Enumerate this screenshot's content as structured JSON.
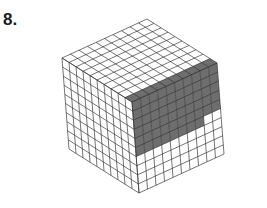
{
  "problem": {
    "number_label": "8."
  },
  "figure": {
    "grid_size": 10,
    "colors": {
      "line": "#3a3a3a",
      "shade": "#6e6e6e",
      "background": "#ffffff"
    },
    "vertices": {
      "top": [
        138,
        16
      ],
      "left": [
        62,
        58
      ],
      "front": [
        132,
        102
      ],
      "right": [
        217,
        63
      ],
      "left_bottom": [
        62,
        149
      ],
      "front_bottom": [
        139,
        193
      ],
      "right_bottom": [
        217,
        154
      ]
    },
    "shading": {
      "top_face_front_strip_depth": 1,
      "right_face_column_depths": [
        6,
        6,
        6,
        6,
        6,
        6,
        6,
        6,
        5,
        5
      ]
    }
  }
}
